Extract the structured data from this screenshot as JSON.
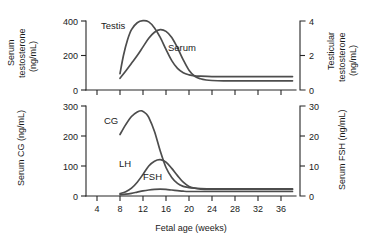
{
  "figure": {
    "panels": [
      {
        "id": "testosterone-panel",
        "left_axis_title_line1": "Serum",
        "left_axis_title_line2": "testosterone",
        "left_axis_title_line3": "(ng/mL)",
        "right_axis_title_line1": "Testicular",
        "right_axis_title_line2": "testosterone",
        "right_axis_title_line3": "(ng/mL)",
        "left_ticks": [
          "0",
          "200",
          "400"
        ],
        "right_ticks": [
          "0",
          "2",
          "4"
        ],
        "curve_labels": [
          "Testis",
          "Serum"
        ]
      },
      {
        "id": "gonadotropin-panel",
        "left_axis_title": "Serum CG (ng/mL)",
        "right_axis_title": "Serum FSH (ng/mL)",
        "left_ticks": [
          "0",
          "100",
          "200",
          "300"
        ],
        "right_ticks": [
          "0",
          "10",
          "20",
          "30"
        ],
        "curve_labels": [
          "CG",
          "LH",
          "FSH"
        ],
        "x_axis_title": "Fetal age (weeks)",
        "x_ticks": [
          "4",
          "8",
          "12",
          "16",
          "20",
          "24",
          "28",
          "32",
          "36"
        ]
      }
    ]
  },
  "chart_data": [
    {
      "type": "line",
      "id": "testosterone-panel",
      "title": "",
      "xlabel": "Fetal age (weeks)",
      "ylabel": "Serum testosterone (ng/mL)",
      "y2label": "Testicular testosterone (ng/mL)",
      "xlim": [
        2,
        38
      ],
      "ylim": [
        0,
        450
      ],
      "y2lim": [
        0,
        4.5
      ],
      "yticks": [
        0,
        200,
        400
      ],
      "y2ticks": [
        0,
        2,
        4
      ],
      "grid": false,
      "legend": "inline-labels",
      "series": [
        {
          "name": "Testis",
          "axis": "right",
          "units": "ng/mL",
          "x": [
            8,
            8.6,
            9.3,
            10,
            11,
            12,
            13,
            14,
            15,
            16,
            17,
            18,
            19,
            20,
            21,
            22,
            24,
            26,
            30,
            34,
            38
          ],
          "values": [
            0.95,
            2.0,
            2.9,
            3.5,
            3.9,
            4.02,
            3.95,
            3.6,
            3.05,
            2.35,
            1.7,
            1.25,
            1.0,
            0.88,
            0.82,
            0.8,
            0.78,
            0.78,
            0.78,
            0.78,
            0.78
          ]
        },
        {
          "name": "Serum",
          "axis": "left",
          "units": "ng/mL",
          "x": [
            8,
            9,
            10,
            11,
            12,
            13,
            14,
            15,
            16,
            17,
            18,
            19,
            20,
            21,
            22,
            23,
            24,
            26,
            30,
            34,
            38
          ],
          "values": [
            68,
            110,
            155,
            200,
            250,
            300,
            335,
            350,
            340,
            305,
            245,
            175,
            115,
            80,
            65,
            58,
            55,
            53,
            53,
            53,
            53
          ]
        }
      ]
    },
    {
      "type": "line",
      "id": "gonadotropin-panel",
      "title": "",
      "xlabel": "Fetal age (weeks)",
      "ylabel": "Serum CG (ng/mL)",
      "y2label": "Serum FSH (ng/mL)",
      "xlim": [
        2,
        38
      ],
      "ylim": [
        0,
        320
      ],
      "y2lim": [
        0,
        32
      ],
      "yticks": [
        0,
        100,
        200,
        300
      ],
      "y2ticks": [
        0,
        10,
        20,
        30
      ],
      "xticks": [
        4,
        8,
        12,
        16,
        20,
        24,
        28,
        32,
        36
      ],
      "grid": false,
      "legend": "inline-labels",
      "series": [
        {
          "name": "CG",
          "axis": "left",
          "units": "ng/mL",
          "x": [
            8,
            9,
            10,
            11,
            11.8,
            12.5,
            13,
            14,
            15,
            16,
            17,
            18,
            19,
            20,
            21,
            22,
            24,
            26,
            30,
            34,
            38
          ],
          "values": [
            205,
            238,
            265,
            280,
            284,
            275,
            262,
            215,
            150,
            95,
            62,
            42,
            32,
            28,
            26,
            25,
            24,
            24,
            24,
            24,
            24
          ]
        },
        {
          "name": "LH",
          "axis": "right",
          "units": "ng/mL",
          "x": [
            8,
            9,
            10,
            11,
            12,
            13,
            14,
            15,
            16,
            17,
            18,
            19,
            20,
            21,
            22,
            24,
            26,
            30,
            34,
            38
          ],
          "values": [
            0.8,
            1.4,
            2.6,
            4.6,
            7.2,
            10.0,
            11.6,
            12.1,
            11.3,
            9.2,
            6.8,
            4.6,
            3.2,
            2.6,
            2.3,
            2.2,
            2.2,
            2.2,
            2.2,
            2.2
          ]
        },
        {
          "name": "FSH",
          "axis": "right",
          "units": "ng/mL",
          "x": [
            8,
            9,
            10,
            11,
            12,
            13,
            14,
            15,
            16,
            17,
            18,
            19,
            20,
            22,
            24,
            26,
            30,
            34,
            38
          ],
          "values": [
            0.4,
            0.6,
            0.9,
            1.3,
            1.7,
            2.0,
            2.2,
            2.3,
            2.2,
            2.0,
            1.8,
            1.6,
            1.5,
            1.5,
            1.5,
            1.5,
            1.5,
            1.5,
            1.5
          ]
        }
      ]
    }
  ]
}
